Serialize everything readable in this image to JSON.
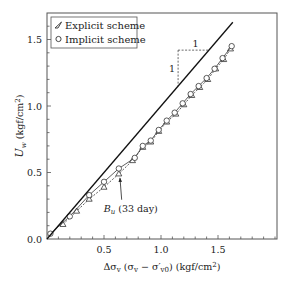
{
  "chart_data": {
    "type": "line",
    "title": "",
    "xlabel": "Δσv (σv − σ′v0) (kgf/cm²)",
    "xlabel_parts": {
      "main": "Δσ",
      "sub1": "v",
      "mid": " (σ",
      "sub2": "v",
      "mid2": " − σ′",
      "sub3": "v0",
      "tail": ") (kgf/cm",
      "sup": "2",
      "end": ")"
    },
    "ylabel": "Uw (kgf/cm²)",
    "ylabel_parts": {
      "main": "U",
      "sub": "w",
      "tail": " (kgf/cm",
      "sup": "2",
      "end": ")"
    },
    "xlim": [
      0,
      2.0
    ],
    "ylim": [
      0,
      1.7
    ],
    "xticks": [
      0.5,
      1.0,
      1.5
    ],
    "xtick_labels": [
      "0.5",
      "1.0",
      "1.5"
    ],
    "yticks": [
      0.0,
      0.5,
      1.0,
      1.5
    ],
    "ytick_labels": [
      "0.0",
      "0.5",
      "1.0",
      "1.5"
    ],
    "minor_tick_step": 0.1,
    "grid": false,
    "legend_position": "top-left",
    "series": [
      {
        "name": "Explicit scheme",
        "marker": "triangle",
        "line_style": "dashed",
        "x": [
          0.14,
          0.26,
          0.37,
          0.5,
          0.63,
          0.75,
          0.84,
          0.91,
          0.98,
          1.05,
          1.13,
          1.2,
          1.27,
          1.34,
          1.41,
          1.48,
          1.55,
          1.61
        ],
        "y": [
          0.11,
          0.21,
          0.3,
          0.39,
          0.49,
          0.59,
          0.69,
          0.73,
          0.81,
          0.88,
          0.94,
          1.01,
          1.08,
          1.14,
          1.2,
          1.28,
          1.35,
          1.43
        ]
      },
      {
        "name": "Implicit scheme",
        "marker": "circle",
        "line_style": "solid",
        "x": [
          0.03,
          0.2,
          0.37,
          0.5,
          0.63,
          0.77,
          0.84,
          0.91,
          0.98,
          1.05,
          1.12,
          1.19,
          1.26,
          1.33,
          1.4,
          1.47,
          1.54,
          1.62
        ],
        "y": [
          0.04,
          0.17,
          0.33,
          0.43,
          0.53,
          0.61,
          0.7,
          0.74,
          0.82,
          0.89,
          0.95,
          1.02,
          1.09,
          1.15,
          1.21,
          1.28,
          1.36,
          1.45
        ]
      },
      {
        "name": "Bu (33 day)",
        "marker": "none",
        "line_style": "solid-thick",
        "x": [
          0.0,
          1.63
        ],
        "y": [
          0.0,
          1.63
        ]
      }
    ],
    "annotations": [
      {
        "text_main": "B",
        "text_sub": "u",
        "text_tail": " (33 day)",
        "arrow_to": [
          0.64,
          0.49
        ],
        "text_at": [
          0.62,
          0.22
        ]
      },
      {
        "type": "slope-triangle",
        "corner": [
          1.15,
          1.42
        ],
        "vertical_to_y": 1.15,
        "horizontal_to_x": 1.42,
        "label_horizontal": "1",
        "label_vertical": "1"
      }
    ]
  }
}
